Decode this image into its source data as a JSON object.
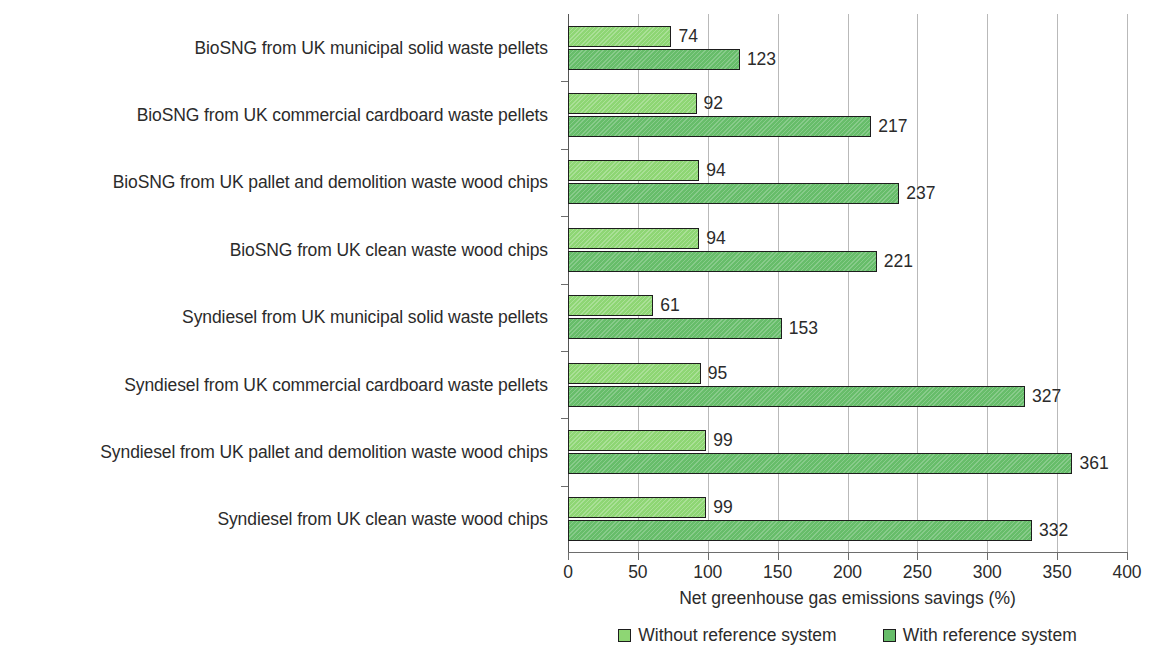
{
  "chart_data": {
    "type": "bar",
    "orientation": "horizontal",
    "title": "",
    "xlabel": "Net greenhouse gas emissions savings (%)",
    "ylabel": "",
    "xlim": [
      0,
      400
    ],
    "xticks": [
      0,
      50,
      100,
      150,
      200,
      250,
      300,
      350,
      400
    ],
    "xticklabels": [
      "0",
      "50",
      "100",
      "150",
      "200",
      "250",
      "300",
      "350",
      "400"
    ],
    "grid": true,
    "grid_axis": "x",
    "legend_position": "bottom",
    "categories": [
      "BioSNG from UK municipal solid waste pellets",
      "BioSNG from UK commercial cardboard waste pellets",
      "BioSNG from UK pallet and demolition waste wood chips",
      "BioSNG from UK clean waste wood chips",
      "Syndiesel from UK municipal solid waste pellets",
      "Syndiesel from UK commercial cardboard waste pellets",
      "Syndiesel from UK pallet and demolition waste wood chips",
      "Syndiesel from UK clean waste wood chips"
    ],
    "series": [
      {
        "name": "Without reference system",
        "color": "#8ed674",
        "values": [
          74,
          92,
          94,
          94,
          61,
          95,
          99,
          99
        ]
      },
      {
        "name": "With reference system",
        "color": "#67bd6a",
        "values": [
          123,
          217,
          237,
          221,
          153,
          327,
          361,
          332
        ]
      }
    ],
    "data_labels": [
      [
        "74",
        "123"
      ],
      [
        "92",
        "217"
      ],
      [
        "94",
        "237"
      ],
      [
        "94",
        "221"
      ],
      [
        "61",
        "153"
      ],
      [
        "95",
        "327"
      ],
      [
        "99",
        "361"
      ],
      [
        "99",
        "332"
      ]
    ]
  },
  "legend": {
    "items": [
      {
        "label": "Without reference system"
      },
      {
        "label": "With reference system"
      }
    ]
  }
}
